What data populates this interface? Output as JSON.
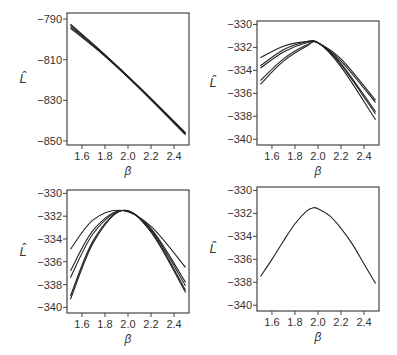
{
  "figure": {
    "ylabel": "L̂",
    "xlabel": "β"
  },
  "chart_data": [
    {
      "type": "line",
      "panel": "top-left",
      "xlabel": "β",
      "ylabel": "L̂",
      "xlim": [
        1.47,
        2.53
      ],
      "ylim": [
        -852,
        -787
      ],
      "xticks": [
        1.6,
        1.8,
        2.0,
        2.2,
        2.4
      ],
      "yticks": [
        -790,
        -810,
        -830,
        -850
      ],
      "ytick_labels": [
        "−790",
        "−810",
        "−830",
        "−850"
      ],
      "series": [
        {
          "name": "curve1",
          "x": [
            1.5,
            1.8,
            2.1,
            2.5
          ],
          "y": [
            -792.5,
            -807.5,
            -823.5,
            -846
          ]
        },
        {
          "name": "curve2",
          "x": [
            1.5,
            1.8,
            2.1,
            2.5
          ],
          "y": [
            -793,
            -807.7,
            -823.7,
            -846.3
          ]
        },
        {
          "name": "curve3",
          "x": [
            1.5,
            1.8,
            2.1,
            2.5
          ],
          "y": [
            -793.7,
            -808,
            -824,
            -846.6
          ]
        },
        {
          "name": "curve4",
          "x": [
            1.5,
            1.8,
            2.1,
            2.5
          ],
          "y": [
            -794.5,
            -808.3,
            -824.2,
            -847
          ]
        }
      ]
    },
    {
      "type": "line",
      "panel": "top-right",
      "xlabel": "β",
      "ylabel": "L̂",
      "xlim": [
        1.47,
        2.53
      ],
      "ylim": [
        -340.5,
        -329.7
      ],
      "xticks": [
        1.6,
        1.8,
        2.0,
        2.2,
        2.4
      ],
      "yticks": [
        -330,
        -332,
        -334,
        -336,
        -338,
        -340
      ],
      "ytick_labels": [
        "−330",
        "−332",
        "−334",
        "−336",
        "−338",
        "−340"
      ],
      "series": [
        {
          "name": "curve1",
          "x": [
            1.5,
            1.7,
            1.9,
            2.0,
            2.2,
            2.5
          ],
          "y": [
            -332.9,
            -331.9,
            -331.5,
            -331.6,
            -333.0,
            -336.6
          ]
        },
        {
          "name": "curve2",
          "x": [
            1.5,
            1.7,
            1.9,
            2.0,
            2.2,
            2.5
          ],
          "y": [
            -333.6,
            -332.2,
            -331.5,
            -331.6,
            -333.2,
            -336.8
          ]
        },
        {
          "name": "curve3",
          "x": [
            1.5,
            1.7,
            1.9,
            2.0,
            2.2,
            2.5
          ],
          "y": [
            -333.8,
            -332.4,
            -331.6,
            -331.6,
            -333.4,
            -337.6
          ]
        },
        {
          "name": "curve4",
          "x": [
            1.5,
            1.7,
            1.9,
            2.0,
            2.2,
            2.5
          ],
          "y": [
            -334.9,
            -333.0,
            -331.8,
            -331.6,
            -333.5,
            -337.8
          ]
        },
        {
          "name": "curve5",
          "x": [
            1.5,
            1.7,
            1.9,
            2.0,
            2.2,
            2.5
          ],
          "y": [
            -335.2,
            -333.2,
            -331.9,
            -331.6,
            -333.7,
            -338.3
          ]
        }
      ]
    },
    {
      "type": "line",
      "panel": "bottom-left",
      "xlabel": "β",
      "ylabel": "L̂",
      "xlim": [
        1.47,
        2.53
      ],
      "ylim": [
        -340.5,
        -329.7
      ],
      "xticks": [
        1.6,
        1.8,
        2.0,
        2.2,
        2.4
      ],
      "yticks": [
        -330,
        -332,
        -334,
        -336,
        -338,
        -340
      ],
      "ytick_labels": [
        "−330",
        "−332",
        "−334",
        "−336",
        "−338",
        "−340"
      ],
      "series": [
        {
          "name": "curve1",
          "x": [
            1.5,
            1.7,
            1.95,
            2.2,
            2.5
          ],
          "y": [
            -334.9,
            -332.3,
            -331.5,
            -332.9,
            -336.5
          ]
        },
        {
          "name": "curve2",
          "x": [
            1.5,
            1.7,
            1.95,
            2.2,
            2.5
          ],
          "y": [
            -336.8,
            -333.2,
            -331.5,
            -333.1,
            -337.8
          ]
        },
        {
          "name": "curve3",
          "x": [
            1.5,
            1.7,
            1.95,
            2.2,
            2.5
          ],
          "y": [
            -337.4,
            -333.5,
            -331.5,
            -333.2,
            -338.1
          ]
        },
        {
          "name": "curve4",
          "x": [
            1.5,
            1.7,
            1.95,
            2.2,
            2.5
          ],
          "y": [
            -339.0,
            -334.1,
            -331.5,
            -333.3,
            -338.5
          ]
        },
        {
          "name": "curve5",
          "x": [
            1.5,
            1.7,
            1.95,
            2.2,
            2.5
          ],
          "y": [
            -339.3,
            -334.3,
            -331.5,
            -333.4,
            -338.7
          ]
        }
      ]
    },
    {
      "type": "line",
      "panel": "bottom-right",
      "xlabel": "β",
      "ylabel": "L̂",
      "xlim": [
        1.47,
        2.53
      ],
      "ylim": [
        -340.5,
        -329.7
      ],
      "xticks": [
        1.6,
        1.8,
        2.0,
        2.2,
        2.4
      ],
      "yticks": [
        -330,
        -332,
        -334,
        -336,
        -338,
        -340
      ],
      "ytick_labels": [
        "−330",
        "−332",
        "−334",
        "−336",
        "−338",
        "−340"
      ],
      "series": [
        {
          "name": "curve1",
          "x": [
            1.5,
            1.6,
            1.7,
            1.8,
            1.9,
            1.96,
            2.0,
            2.1,
            2.2,
            2.3,
            2.4,
            2.5
          ],
          "y": [
            -337.5,
            -336.0,
            -334.4,
            -332.9,
            -331.8,
            -331.5,
            -331.6,
            -332.2,
            -333.3,
            -334.7,
            -336.4,
            -338.1
          ]
        }
      ]
    }
  ]
}
